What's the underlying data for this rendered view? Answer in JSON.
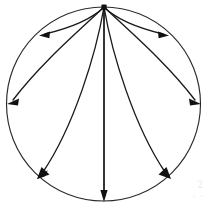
{
  "figure": {
    "background_color": "#ffffff",
    "line_color": "#1a1a1a",
    "circle_color": "#2b2b2b",
    "watermark": {
      "line1": "2",
      "line2": "· ·"
    },
    "canvas": {
      "width": 208,
      "height": 208
    },
    "circle": {
      "cx": 103.5,
      "cy": 104,
      "r": 97
    },
    "source_point": {
      "x": 104,
      "y": 7,
      "radius": 2.6,
      "label": "source-vertex"
    },
    "flow_lines": [
      {
        "name": "upper-left-arc",
        "direction": "left",
        "start": {
          "x": 104,
          "y": 7
        },
        "end": {
          "x": 42,
          "y": 35
        },
        "arrow_angle_deg": 186
      },
      {
        "name": "upper-right-arc",
        "direction": "right",
        "start": {
          "x": 104,
          "y": 7
        },
        "end": {
          "x": 166,
          "y": 35
        },
        "arrow_angle_deg": 354
      },
      {
        "name": "mid-left-arc",
        "direction": "left",
        "start": {
          "x": 104,
          "y": 7
        },
        "end": {
          "x": 8,
          "y": 104
        },
        "arrow_angle_deg": 183
      },
      {
        "name": "mid-right-arc",
        "direction": "right",
        "start": {
          "x": 104,
          "y": 7
        },
        "end": {
          "x": 200,
          "y": 104
        },
        "arrow_angle_deg": 357
      },
      {
        "name": "lower-left-arc",
        "direction": "down-left",
        "start": {
          "x": 104,
          "y": 7
        },
        "end": {
          "x": 40,
          "y": 176
        },
        "arrow_angle_deg": 225
      },
      {
        "name": "lower-right-arc",
        "direction": "down-right",
        "start": {
          "x": 104,
          "y": 7
        },
        "end": {
          "x": 168,
          "y": 176
        },
        "arrow_angle_deg": 315
      },
      {
        "name": "vertical-axis-line",
        "direction": "down",
        "start": {
          "x": 104,
          "y": 7
        },
        "end": {
          "x": 104,
          "y": 200
        },
        "arrow_angle_deg": 90
      }
    ]
  }
}
